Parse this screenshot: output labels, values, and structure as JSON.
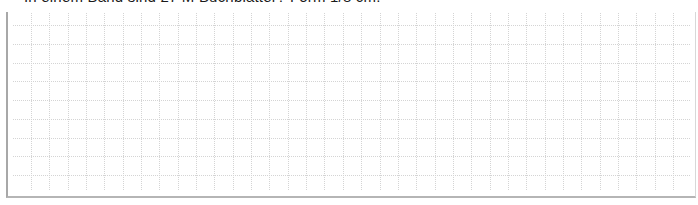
{
  "question": {
    "text": "In einem Band sind 27 M Buchblätter? Form 1/8 cm."
  },
  "answer_area": {
    "type": "grid-paper",
    "rows": 9,
    "columns": 36,
    "line_color": "#d4d4d4",
    "border_color": "#a8a8a8"
  }
}
